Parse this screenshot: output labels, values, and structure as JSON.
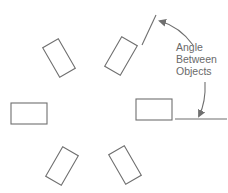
{
  "diagram": {
    "annotation": {
      "lines": [
        "Angle",
        "Between",
        "Objects"
      ]
    },
    "colors": {
      "stroke": "#6f6f6f",
      "text": "#6a6a6a",
      "background": "#ffffff"
    },
    "objects": [
      {
        "name": "top-left",
        "cx": 59,
        "cy": 58,
        "w": 18,
        "h": 34,
        "rotate": -30
      },
      {
        "name": "top-right",
        "cx": 121,
        "cy": 56,
        "w": 18,
        "h": 34,
        "rotate": 30
      },
      {
        "name": "left",
        "cx": 29,
        "cy": 114,
        "w": 36,
        "h": 21,
        "rotate": 0
      },
      {
        "name": "right",
        "cx": 154,
        "cy": 110,
        "w": 36,
        "h": 21,
        "rotate": 0
      },
      {
        "name": "bottom-left",
        "cx": 62,
        "cy": 166,
        "w": 18,
        "h": 34,
        "rotate": 30
      },
      {
        "name": "bottom-right",
        "cx": 125,
        "cy": 165,
        "w": 18,
        "h": 34,
        "rotate": -30
      }
    ]
  }
}
